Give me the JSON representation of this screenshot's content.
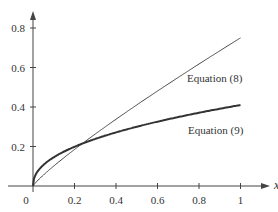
{
  "chart_data": {
    "type": "line",
    "title": "",
    "xlabel": "x",
    "ylabel": "",
    "xlim": [
      0,
      1
    ],
    "ylim": [
      0,
      0.8
    ],
    "grid": false,
    "x_ticks": [
      "0",
      "0.2",
      "0.4",
      "0.6",
      "0.8",
      "1"
    ],
    "y_ticks": [
      "0.2",
      "0.4",
      "0.6",
      "0.8"
    ],
    "x": [
      0,
      0.05,
      0.1,
      0.2,
      0.3,
      0.4,
      0.5,
      0.6,
      0.7,
      0.8,
      0.9,
      1.0
    ],
    "series": [
      {
        "name": "Equation (8)",
        "values": [
          0,
          0.055,
          0.1,
          0.19,
          0.27,
          0.35,
          0.42,
          0.5,
          0.57,
          0.63,
          0.69,
          0.75
        ],
        "stroke": "thin"
      },
      {
        "name": "Equation (9)",
        "values": [
          0,
          0.11,
          0.14,
          0.19,
          0.22,
          0.25,
          0.28,
          0.31,
          0.34,
          0.37,
          0.39,
          0.41
        ],
        "stroke": "thick"
      }
    ],
    "annotations": [
      "Equation (8)",
      "Equation (9)"
    ]
  },
  "labels": {
    "eq8": "Equation (8)",
    "eq9": "Equation (9)",
    "xaxis": "x",
    "origin": "0"
  }
}
